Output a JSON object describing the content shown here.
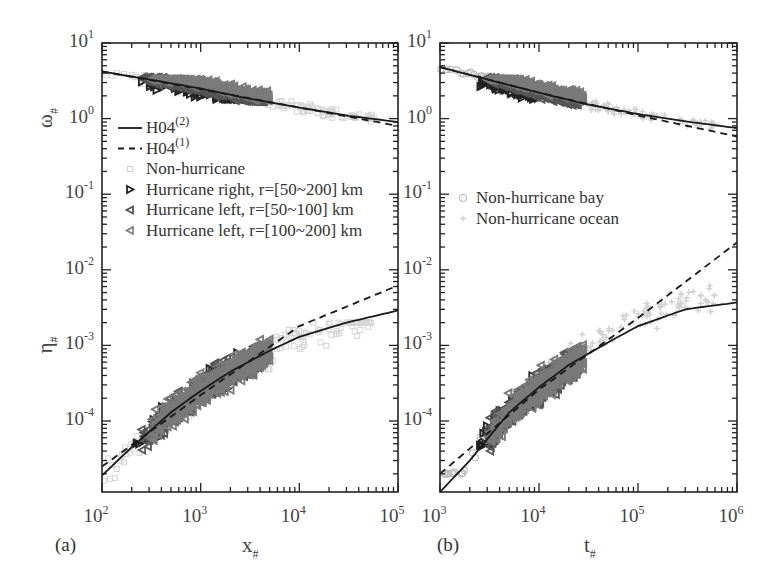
{
  "chart_data": [
    {
      "type": "scatter",
      "panel_label": "(a)",
      "xlabel": "x",
      "xlabel_sub": "#",
      "ylabel_top": "ω",
      "ylabel_top_sub": "#",
      "ylabel_bottom": "η",
      "ylabel_bottom_sub": "#",
      "xscale": "log",
      "yscale": "log",
      "xlim": [
        100,
        100000
      ],
      "ylim": [
        1.15e-05,
        10
      ],
      "x_ticks": [
        {
          "base": "10",
          "exp": "2",
          "value": 100
        },
        {
          "base": "10",
          "exp": "3",
          "value": 1000
        },
        {
          "base": "10",
          "exp": "4",
          "value": 10000
        },
        {
          "base": "10",
          "exp": "5",
          "value": 100000
        }
      ],
      "y_ticks": [
        {
          "base": "10",
          "exp": "1",
          "value": 10
        },
        {
          "base": "10",
          "exp": "0",
          "value": 1
        },
        {
          "base": "10",
          "exp": "-1",
          "value": 0.1
        },
        {
          "base": "10",
          "exp": "-2",
          "value": 0.01
        },
        {
          "base": "10",
          "exp": "-3",
          "value": 0.001
        },
        {
          "base": "10",
          "exp": "-4",
          "value": 0.0001
        }
      ],
      "legend_position": "center-left",
      "legend": [
        {
          "label": "H04",
          "sup": "(2)",
          "style": "solid-line"
        },
        {
          "label": "H04",
          "sup": "(1)",
          "style": "dashed-line"
        },
        {
          "label": "Non-hurricane",
          "sup": "",
          "style": "light-square"
        },
        {
          "label": "Hurricane right, r=[50~200] km",
          "sup": "",
          "style": "right-triangle-black"
        },
        {
          "label": "Hurricane left, r=[50~100] km",
          "sup": "",
          "style": "left-triangle-dark"
        },
        {
          "label": "Hurricane left, r=[100~200] km",
          "sup": "",
          "style": "left-triangle-gray"
        }
      ],
      "series": [
        {
          "name": "H04(2) omega",
          "style": "solid",
          "x": [
            100,
            300,
            1000,
            3000,
            10000,
            30000,
            100000
          ],
          "y": [
            4.2,
            3.3,
            2.5,
            1.85,
            1.4,
            1.1,
            0.9
          ]
        },
        {
          "name": "H04(1) omega",
          "style": "dashed",
          "x": [
            100,
            1000,
            10000,
            100000
          ],
          "y": [
            4.2,
            2.45,
            1.4,
            0.8
          ]
        },
        {
          "name": "H04(2) eta",
          "style": "solid",
          "x": [
            100,
            200,
            500,
            1000,
            2000,
            5000,
            10000,
            30000,
            100000
          ],
          "y": [
            1.9e-05,
            4.5e-05,
            0.00013,
            0.00025,
            0.00045,
            0.00085,
            0.0013,
            0.002,
            0.0029
          ]
        },
        {
          "name": "H04(1) eta",
          "style": "dashed",
          "x": [
            100,
            1000,
            10000,
            100000
          ],
          "y": [
            2.5e-05,
            0.00022,
            0.0018,
            0.0062
          ]
        }
      ],
      "scatter_groups": [
        {
          "name": "Non-hurricane",
          "color": "#d4d4d4",
          "x_range": [
            100,
            60000
          ],
          "omega_range": [
            0.9,
            4.0
          ],
          "eta_range": [
            1.2e-05,
            0.002
          ]
        },
        {
          "name": "Hurricane right, r=[50~200] km",
          "color": "#222222",
          "x_range": [
            200,
            3500
          ],
          "omega_range": [
            1.8,
            3.8
          ],
          "eta_range": [
            3e-05,
            0.0008
          ]
        },
        {
          "name": "Hurricane left, r=[50~100] km",
          "color": "#555555",
          "x_range": [
            250,
            4500
          ],
          "omega_range": [
            1.7,
            3.5
          ],
          "eta_range": [
            4e-05,
            0.0012
          ]
        },
        {
          "name": "Hurricane left, r=[100~200] km",
          "color": "#7a7a7a",
          "x_range": [
            300,
            5000
          ],
          "omega_range": [
            1.5,
            3.3
          ],
          "eta_range": [
            4e-05,
            0.0012
          ]
        }
      ]
    },
    {
      "type": "scatter",
      "panel_label": "(b)",
      "xlabel": "t",
      "xlabel_sub": "#",
      "xscale": "log",
      "yscale": "log",
      "xlim": [
        1000,
        1000000
      ],
      "ylim": [
        1.15e-05,
        10
      ],
      "x_ticks": [
        {
          "base": "10",
          "exp": "3",
          "value": 1000
        },
        {
          "base": "10",
          "exp": "4",
          "value": 10000
        },
        {
          "base": "10",
          "exp": "5",
          "value": 100000
        },
        {
          "base": "10",
          "exp": "6",
          "value": 1000000
        }
      ],
      "y_ticks": [
        {
          "base": "10",
          "exp": "1",
          "value": 10
        },
        {
          "base": "10",
          "exp": "0",
          "value": 1
        },
        {
          "base": "10",
          "exp": "-1",
          "value": 0.1
        },
        {
          "base": "10",
          "exp": "-2",
          "value": 0.01
        },
        {
          "base": "10",
          "exp": "-3",
          "value": 0.001
        },
        {
          "base": "10",
          "exp": "-4",
          "value": 0.0001
        }
      ],
      "legend_position": "center-left",
      "legend": [
        {
          "label": "Non-hurricane bay",
          "sup": "",
          "style": "light-circle"
        },
        {
          "label": "Non-hurricane ocean",
          "sup": "",
          "style": "light-plus"
        }
      ],
      "series": [
        {
          "name": "H04(2) omega",
          "style": "solid",
          "x": [
            1000,
            3000,
            10000,
            30000,
            100000,
            300000,
            1000000
          ],
          "y": [
            4.8,
            3.3,
            2.2,
            1.55,
            1.15,
            0.92,
            0.75
          ]
        },
        {
          "name": "H04(1) omega",
          "style": "dashed",
          "x": [
            1000,
            10000,
            100000,
            1000000
          ],
          "y": [
            4.8,
            2.2,
            1.1,
            0.58
          ]
        },
        {
          "name": "H04(2) eta",
          "style": "solid",
          "x": [
            1000,
            2000,
            5000,
            10000,
            20000,
            50000,
            100000,
            300000,
            1000000
          ],
          "y": [
            1.15e-05,
            3e-05,
            0.00013,
            0.00028,
            0.00055,
            0.0011,
            0.0018,
            0.003,
            0.0037
          ]
        },
        {
          "name": "H04(1) eta",
          "style": "dashed",
          "x": [
            1000,
            10000,
            100000,
            1000000
          ],
          "y": [
            2e-05,
            0.00026,
            0.0023,
            0.023
          ]
        }
      ],
      "scatter_groups": [
        {
          "name": "Non-hurricane bay",
          "color": "#bdbdbd",
          "x_range": [
            1000,
            15000
          ],
          "omega_range": [
            2.5,
            4.5
          ],
          "eta_range": [
            2e-05,
            0.00025
          ]
        },
        {
          "name": "Non-hurricane ocean",
          "color": "#d0d0d0",
          "x_range": [
            5000,
            600000
          ],
          "omega_range": [
            0.5,
            3.5
          ],
          "eta_range": [
            0.0001,
            0.02
          ]
        },
        {
          "name": "Hurricane right, r=[50~200] km",
          "color": "#222222",
          "x_range": [
            2500,
            10000
          ],
          "omega_range": [
            1.8,
            3.8
          ],
          "eta_range": [
            3e-05,
            0.0008
          ]
        },
        {
          "name": "Hurricane left, r=[50~100] km",
          "color": "#555555",
          "x_range": [
            3000,
            25000
          ],
          "omega_range": [
            1.5,
            3.5
          ],
          "eta_range": [
            4e-05,
            0.0012
          ]
        },
        {
          "name": "Hurricane left, r=[100~200] km",
          "color": "#7a7a7a",
          "x_range": [
            3000,
            28000
          ],
          "omega_range": [
            1.3,
            3.3
          ],
          "eta_range": [
            4e-05,
            0.0012
          ]
        }
      ]
    }
  ]
}
